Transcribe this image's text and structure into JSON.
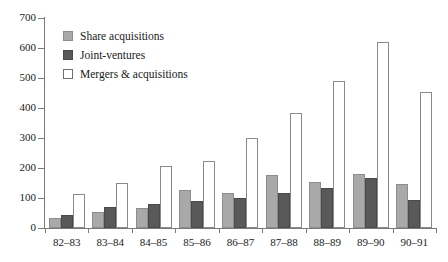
{
  "chart_data": {
    "type": "bar",
    "title": "",
    "xlabel": "",
    "ylabel": "",
    "ylim": [
      0,
      700
    ],
    "ytick_step": 100,
    "yticks": [
      "0",
      "100",
      "200",
      "300",
      "400",
      "500",
      "600",
      "700"
    ],
    "grid": false,
    "legend_position": "top-left",
    "categories": [
      "82–83",
      "83–84",
      "84–85",
      "85–86",
      "86–87",
      "87–88",
      "88–89",
      "89–90",
      "90–91"
    ],
    "series": [
      {
        "name": "Share acquisitions",
        "color": "#a9a9a9",
        "values": [
          33,
          55,
          68,
          128,
          118,
          178,
          155,
          180,
          148
        ]
      },
      {
        "name": "Joint-ventures",
        "color": "#595959",
        "values": [
          45,
          70,
          80,
          90,
          100,
          118,
          135,
          168,
          95
        ]
      },
      {
        "name": "Mergers & acquisitions",
        "color": "#ffffff",
        "values": [
          115,
          150,
          208,
          225,
          300,
          385,
          490,
          620,
          455
        ]
      }
    ]
  }
}
